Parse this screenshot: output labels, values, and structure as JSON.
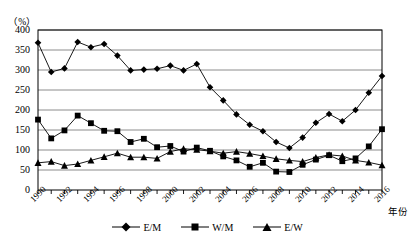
{
  "chart_data": {
    "type": "line",
    "title": "",
    "unit_label": "（%）",
    "xlabel": "年份",
    "ylabel": "",
    "ylim": [
      0,
      400
    ],
    "ytick_step": 50,
    "yticks": [
      "400",
      "350",
      "300",
      "250",
      "200",
      "150",
      "100",
      "50",
      "0"
    ],
    "grid": true,
    "legend_position": "bottom-center",
    "x": [
      1990,
      1991,
      1992,
      1993,
      1994,
      1995,
      1996,
      1997,
      1998,
      1999,
      2000,
      2001,
      2002,
      2003,
      2004,
      2005,
      2006,
      2007,
      2008,
      2009,
      2010,
      2011,
      2012,
      2013,
      2014,
      2015,
      2016
    ],
    "xtick_labels": [
      "1990",
      "1992",
      "1994",
      "1996",
      "1998",
      "2000",
      "2002",
      "2004",
      "2006",
      "2008",
      "2010",
      "2012",
      "2014",
      "2016"
    ],
    "series": [
      {
        "name": "E/M",
        "marker": "diamond",
        "values": [
          368,
          295,
          304,
          370,
          357,
          365,
          336,
          299,
          301,
          303,
          311,
          299,
          315,
          257,
          224,
          189,
          163,
          147,
          120,
          105,
          131,
          168,
          190,
          172,
          200,
          243,
          285
        ]
      },
      {
        "name": "W/M",
        "marker": "square",
        "values": [
          176,
          129,
          149,
          186,
          167,
          148,
          147,
          120,
          128,
          107,
          110,
          96,
          106,
          98,
          84,
          74,
          58,
          68,
          46,
          45,
          63,
          76,
          87,
          72,
          79,
          109,
          152
        ]
      },
      {
        "name": "E/W",
        "marker": "triangle",
        "values": [
          68,
          71,
          61,
          65,
          74,
          83,
          92,
          82,
          82,
          79,
          96,
          103,
          101,
          97,
          92,
          96,
          91,
          85,
          78,
          74,
          71,
          81,
          88,
          85,
          74,
          69,
          62
        ]
      }
    ]
  },
  "legend": {
    "items": [
      {
        "label": "E/M"
      },
      {
        "label": "W/M"
      },
      {
        "label": "E/W"
      }
    ]
  },
  "colors": {
    "series": "#000000",
    "grid": "#808080",
    "axis": "#000000",
    "background": "#ffffff"
  }
}
